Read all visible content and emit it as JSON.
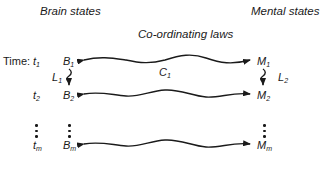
{
  "headers": {
    "left": "Brain states",
    "center": "Co-ordinating laws",
    "right": "Mental states"
  },
  "time_label": "Time:",
  "rows": [
    {
      "time": "t",
      "time_sub": "1",
      "brain": "B",
      "brain_sub": "1",
      "mental": "M",
      "mental_sub": "1"
    },
    {
      "time": "t",
      "time_sub": "2",
      "brain": "B",
      "brain_sub": "2",
      "mental": "M",
      "mental_sub": "2"
    },
    {
      "time": "t",
      "time_sub": "m",
      "brain": "B",
      "brain_sub": "m",
      "mental": "M",
      "mental_sub": "m"
    }
  ],
  "laws": {
    "coordinating": {
      "label": "C",
      "sub": "1"
    },
    "brain_transition": {
      "label": "L",
      "sub": "1"
    },
    "mental_transition": {
      "label": "L",
      "sub": "2"
    }
  },
  "colors": {
    "stroke": "#1a1a1a",
    "background": "#ffffff"
  }
}
